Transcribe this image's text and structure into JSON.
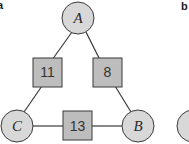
{
  "panels": [
    {
      "label": "a"
    },
    {
      "label": "b"
    }
  ],
  "diagram": {
    "nodes": [
      {
        "id": "A",
        "label": "A",
        "shape": "circle",
        "cx": 78,
        "cy": 18
      },
      {
        "id": "B",
        "label": "B",
        "shape": "circle",
        "cx": 138,
        "cy": 126
      },
      {
        "id": "C",
        "label": "C",
        "shape": "circle",
        "cx": 17,
        "cy": 126
      }
    ],
    "edges": [
      {
        "from": "A",
        "to": "C",
        "weight": "11"
      },
      {
        "from": "A",
        "to": "B",
        "weight": "8"
      },
      {
        "from": "C",
        "to": "B",
        "weight": "13"
      }
    ]
  },
  "colors": {
    "node_fill": "#d8d8d8",
    "box_fill": "#bdbdbd",
    "stroke": "#3a3a3a"
  }
}
